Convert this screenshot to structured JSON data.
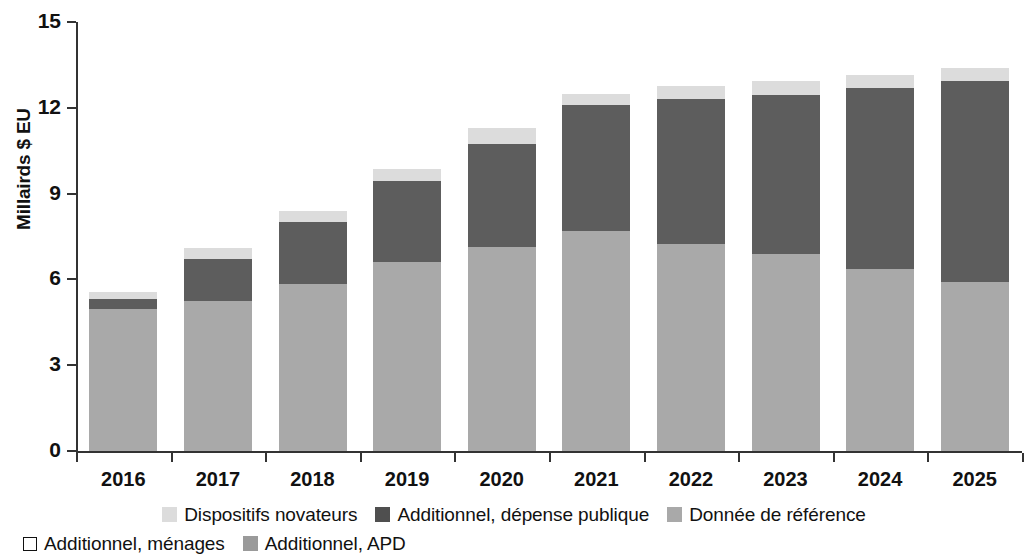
{
  "chart_data": {
    "type": "bar",
    "subtype": "stacked",
    "title": "",
    "xlabel": "",
    "ylabel": "Millairds $ EU",
    "ylim": [
      0,
      15
    ],
    "yticks": [
      0,
      3,
      6,
      9,
      12,
      15
    ],
    "grid": false,
    "legend_position": "bottom",
    "categories": [
      "2016",
      "2017",
      "2018",
      "2019",
      "2020",
      "2021",
      "2022",
      "2023",
      "2024",
      "2025"
    ],
    "series": [
      {
        "name": "Donnée de référence",
        "color": "#a9a9a9",
        "values": [
          4.95,
          5.25,
          5.85,
          6.6,
          7.15,
          7.7,
          7.25,
          6.9,
          6.35,
          5.9
        ]
      },
      {
        "name": "Additionnel, dépense publique",
        "color": "#5d5d5d",
        "values": [
          0.35,
          1.45,
          2.15,
          2.85,
          3.6,
          4.4,
          5.05,
          5.55,
          6.35,
          7.05
        ]
      },
      {
        "name": "Dispositifs novateurs",
        "color": "#dcdcdc",
        "values": [
          0.25,
          0.4,
          0.4,
          0.4,
          0.55,
          0.4,
          0.45,
          0.5,
          0.45,
          0.45
        ]
      }
    ],
    "totals": [
      5.55,
      7.1,
      8.4,
      9.85,
      11.3,
      12.5,
      12.75,
      12.95,
      13.15,
      13.4
    ]
  },
  "legend": {
    "row1": [
      {
        "label": "Dispositifs novateurs",
        "swatch": "innov-swatch",
        "color": "#dcdcdc"
      },
      {
        "label": "Additionnel, dépense publique",
        "swatch": "public-swatch",
        "color": "#4f4f4f"
      },
      {
        "label": "Donnée de référence",
        "swatch": "base-swatch",
        "color": "#a9a9a9"
      }
    ],
    "row2": [
      {
        "label": "Additionnel, ménages",
        "swatch": "households-swatch",
        "color": "#ffffff"
      },
      {
        "label": "Additionnel, APD",
        "swatch": "apd-swatch",
        "color": "#9a9a9a"
      }
    ]
  }
}
